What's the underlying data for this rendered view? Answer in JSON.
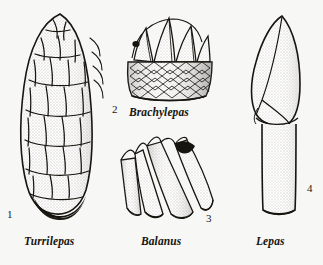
{
  "plate": {
    "background_color": "#f7f7f5",
    "ink_color": "#1a1814",
    "description": "Scientific line illustration plate of four barnacle (cirripede) genera, stippled pen-and-ink style"
  },
  "figures": [
    {
      "number": "1",
      "name": "Turrilepas",
      "icon": "turrilepas-specimen-icon",
      "note": "elongated cone of overlapping scale-like plates with dark base"
    },
    {
      "number": "2",
      "name": "Brachylepas",
      "icon": "brachylepas-specimen-icon",
      "note": "conical shell with triangular apical plates over a diamond-scaled basal band"
    },
    {
      "number": "3",
      "name": "Balanus",
      "icon": "balanus-specimen-icon",
      "note": "overlapping vertical wall plates with dark triangular aperture at top"
    },
    {
      "number": "4",
      "name": "Lepas",
      "icon": "lepas-specimen-icon",
      "note": "pointed capitulum on a smooth cylindrical peduncle"
    }
  ]
}
